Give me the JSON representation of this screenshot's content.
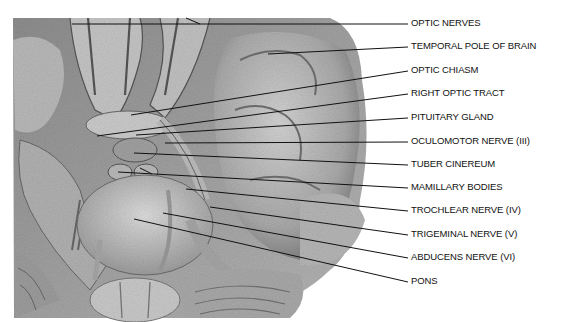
{
  "figure": {
    "type": "anatomical-illustration",
    "labels": [
      {
        "text": "OPTIC NERVES",
        "y": 23
      },
      {
        "text": "TEMPORAL POLE OF BRAIN",
        "y": 46
      },
      {
        "text": "OPTIC CHIASM",
        "y": 70
      },
      {
        "text": "RIGHT OPTIC TRACT",
        "y": 93
      },
      {
        "text": "PITUITARY GLAND",
        "y": 117
      },
      {
        "text": "OCULOMOTOR NERVE  (III)",
        "y": 141
      },
      {
        "text": "TUBER CINEREUM",
        "y": 164
      },
      {
        "text": "MAMILLARY BODIES",
        "y": 187
      },
      {
        "text": "TROCHLEAR NERVE  (IV)",
        "y": 210
      },
      {
        "text": "TRIGEMINAL NERVE  (V)",
        "y": 234
      },
      {
        "text": "ABDUCENS NERVE  (VI)",
        "y": 257
      },
      {
        "text": "PONS",
        "y": 281
      }
    ]
  }
}
